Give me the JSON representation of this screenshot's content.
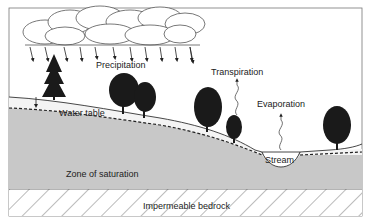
{
  "diagram": {
    "type": "groundwater-cross-section",
    "labels": {
      "precipitation": "Precipitation",
      "transpiration": "Transpiration",
      "evaporation": "Evaporation",
      "water_table": "Water table",
      "stream": "Stream",
      "zone_of_saturation": "Zone of saturation",
      "bedrock": "Impermeable bedrock"
    },
    "colors": {
      "saturated_zone": "#c8c8c8",
      "unsaturated_zone": "#f4f4f4",
      "outline": "#333333",
      "trees": "#1a1a1a",
      "background": "#ffffff"
    }
  }
}
